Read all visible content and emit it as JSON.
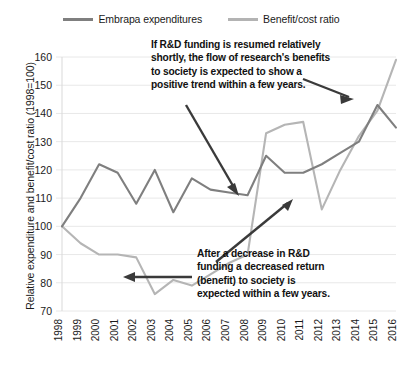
{
  "legend": {
    "entries": [
      {
        "label": "Embrapa expenditures",
        "color": "#7f7f7f",
        "swatch": "line-swatch-dark"
      },
      {
        "label": "Benefit/cost ratio",
        "color": "#b5b5b5",
        "swatch": "line-swatch-light"
      }
    ]
  },
  "annotations": {
    "top": {
      "lines": [
        "If R&D funding is resumed relatively",
        "shortly, the flow of research's benefits",
        "to society is expected to show a",
        "positive trend within a few years."
      ]
    },
    "bottom": {
      "lines": [
        "After a decrease in R&D",
        "funding a decreased return",
        "(benefit) to society is",
        "expected within a few years."
      ]
    }
  },
  "chart_data": {
    "type": "line",
    "title": "",
    "xlabel": "",
    "ylabel": "Relative expenditure and benefit/cost ratio (1998=100)",
    "ylim": [
      70,
      160
    ],
    "yticks": [
      70,
      80,
      90,
      100,
      110,
      120,
      130,
      140,
      150,
      160
    ],
    "grid": true,
    "legend_position": "top",
    "categories": [
      "1998",
      "1999",
      "2000",
      "2001",
      "2002",
      "2003",
      "2004",
      "2005",
      "2006",
      "2007",
      "2008",
      "2009",
      "2010",
      "2011",
      "2012",
      "2013",
      "2014",
      "2015",
      "2016"
    ],
    "series": [
      {
        "name": "Embrapa expenditures",
        "color": "#7f7f7f",
        "values": [
          100,
          110,
          122,
          119,
          108,
          120,
          105,
          117,
          113,
          112,
          111,
          125,
          119,
          119,
          122,
          126,
          130,
          143,
          135
        ]
      },
      {
        "name": "Benefit/cost ratio",
        "color": "#b5b5b5",
        "values": [
          100,
          94,
          90,
          90,
          89,
          76,
          81,
          79,
          83,
          87,
          90,
          133,
          136,
          137,
          106,
          120,
          132,
          141,
          159
        ]
      }
    ]
  }
}
